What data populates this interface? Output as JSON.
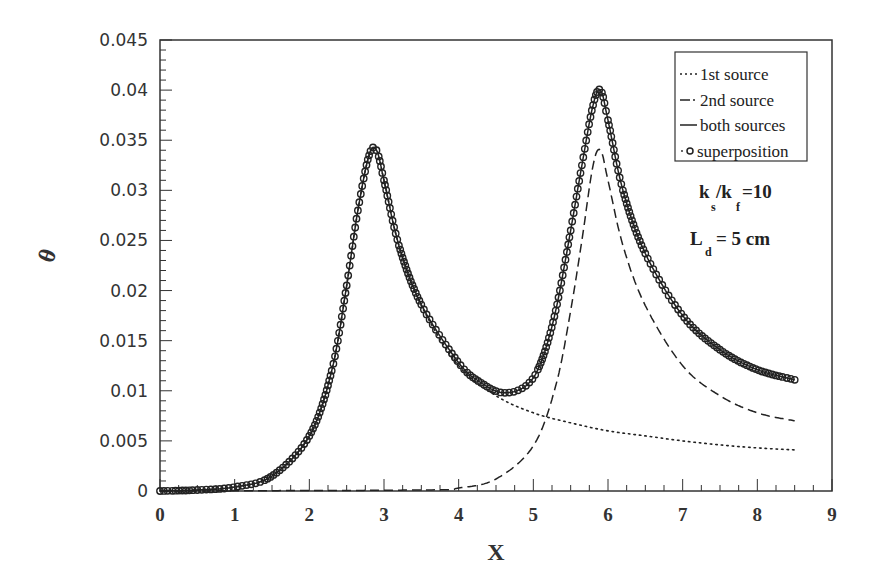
{
  "chart_data": {
    "type": "line",
    "title": "",
    "xlabel": "X",
    "ylabel": "θ",
    "xlim": [
      0,
      9
    ],
    "ylim": [
      0,
      0.045
    ],
    "x_ticks": [
      "0",
      "1",
      "2",
      "3",
      "4",
      "5",
      "6",
      "7",
      "8",
      "9"
    ],
    "y_ticks": [
      "0",
      "0.005",
      "0.01",
      "0.015",
      "0.02",
      "0.025",
      "0.03",
      "0.035",
      "0.04",
      "0.045"
    ],
    "grid": false,
    "legend_position": "upper right",
    "legend": [
      {
        "label": "1st source",
        "style": "dotted"
      },
      {
        "label": "2nd source",
        "style": "dashed"
      },
      {
        "label": "both sources",
        "style": "solid"
      },
      {
        "label": "superposition",
        "style": "circles"
      }
    ],
    "annotations": [
      {
        "text": "ks/kf = 10",
        "main1": "k",
        "sub1": "s",
        "mid": "/k",
        "sub2": "f",
        "tail": "=10"
      },
      {
        "text": "Ld = 5 cm",
        "main": "L",
        "sub": "d",
        "tail": "= 5 cm"
      }
    ],
    "series": [
      {
        "name": "1st source",
        "x": [
          0,
          0.5,
          1.0,
          1.5,
          2.0,
          2.3,
          2.5,
          2.65,
          2.8,
          2.9,
          3.0,
          3.2,
          3.5,
          4.0,
          4.5,
          5.0,
          5.5,
          6.0,
          6.5,
          7.0,
          7.5,
          8.0,
          8.5
        ],
        "y": [
          0,
          0.0001,
          0.0004,
          0.0015,
          0.0055,
          0.012,
          0.0205,
          0.028,
          0.0335,
          0.034,
          0.031,
          0.0245,
          0.0185,
          0.0125,
          0.0095,
          0.0078,
          0.0068,
          0.006,
          0.0055,
          0.005,
          0.0046,
          0.0043,
          0.0041
        ]
      },
      {
        "name": "2nd source",
        "x": [
          0,
          3.5,
          4.0,
          4.5,
          5.0,
          5.3,
          5.5,
          5.65,
          5.8,
          5.9,
          6.0,
          6.2,
          6.5,
          7.0,
          7.5,
          8.0,
          8.5
        ],
        "y": [
          0,
          0.0001,
          0.0003,
          0.0012,
          0.0045,
          0.0105,
          0.018,
          0.025,
          0.0325,
          0.034,
          0.031,
          0.0245,
          0.0185,
          0.0125,
          0.0095,
          0.0078,
          0.007
        ]
      },
      {
        "name": "both sources",
        "x": [
          0,
          0.5,
          1.0,
          1.5,
          2.0,
          2.3,
          2.5,
          2.65,
          2.8,
          2.9,
          3.0,
          3.2,
          3.5,
          4.0,
          4.3,
          4.6,
          4.9,
          5.1,
          5.3,
          5.5,
          5.65,
          5.8,
          5.9,
          6.0,
          6.2,
          6.5,
          7.0,
          7.5,
          8.0,
          8.5
        ],
        "y": [
          0,
          0.0001,
          0.0004,
          0.0015,
          0.0055,
          0.012,
          0.0205,
          0.028,
          0.0335,
          0.034,
          0.031,
          0.0245,
          0.0186,
          0.0128,
          0.0108,
          0.0098,
          0.0105,
          0.0128,
          0.018,
          0.026,
          0.0325,
          0.0385,
          0.04,
          0.037,
          0.03,
          0.0237,
          0.0175,
          0.0141,
          0.0121,
          0.0111
        ]
      },
      {
        "name": "superposition",
        "x": [
          0,
          0.5,
          1.0,
          1.5,
          2.0,
          2.3,
          2.5,
          2.65,
          2.8,
          2.9,
          3.0,
          3.2,
          3.5,
          4.0,
          4.3,
          4.6,
          4.9,
          5.1,
          5.3,
          5.5,
          5.65,
          5.8,
          5.9,
          6.0,
          6.2,
          6.5,
          7.0,
          7.5,
          8.0,
          8.5
        ],
        "y": [
          0,
          0.0001,
          0.0004,
          0.0015,
          0.0055,
          0.012,
          0.0205,
          0.028,
          0.0335,
          0.034,
          0.031,
          0.0245,
          0.0186,
          0.0128,
          0.0108,
          0.0098,
          0.0105,
          0.0128,
          0.018,
          0.026,
          0.0325,
          0.0385,
          0.04,
          0.037,
          0.03,
          0.0237,
          0.0175,
          0.0141,
          0.0121,
          0.0111
        ]
      }
    ]
  },
  "colors": {
    "ink": "#222222",
    "frame": "#333333",
    "background": "#ffffff"
  }
}
